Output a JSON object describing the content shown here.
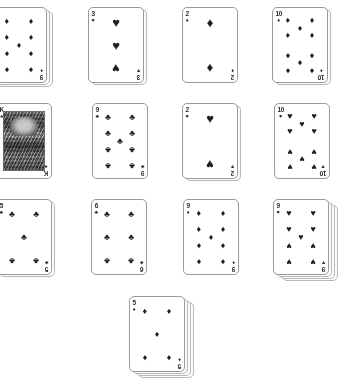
{
  "scene": {
    "title": "Playing card layout",
    "background_color": "#ffffff",
    "card_face_color": "#ffffff",
    "card_border_color": "#9a9a9a",
    "pip_color": "#1f1f1f",
    "card_width": 56,
    "card_height": 76,
    "card_count_visible": 13
  },
  "suit_glyphs": {
    "spades": "♠",
    "hearts": "♥",
    "diamonds": "♦",
    "clubs": "♣"
  },
  "cards": [
    {
      "id": "r1c1",
      "rank": "9",
      "suit": "diamonds",
      "suit_glyph": "♦",
      "label": "9 of Diamonds",
      "x": -9,
      "y": 7,
      "stack_behind": 2,
      "court": false,
      "clipped": "left"
    },
    {
      "id": "r1c2",
      "rank": "3",
      "suit": "hearts",
      "suit_glyph": "♥",
      "label": "3 of Hearts",
      "x": 88,
      "y": 7,
      "stack_behind": 1,
      "court": false,
      "clipped": ""
    },
    {
      "id": "r1c3",
      "rank": "2",
      "suit": "diamonds",
      "suit_glyph": "♦",
      "label": "2 of Diamonds",
      "x": 182,
      "y": 7,
      "stack_behind": 0,
      "court": false,
      "clipped": ""
    },
    {
      "id": "r1c4",
      "rank": "10",
      "suit": "diamonds",
      "suit_glyph": "♦",
      "label": "10 of Diamonds",
      "x": 272,
      "y": 7,
      "stack_behind": 1,
      "court": false,
      "clipped": ""
    },
    {
      "id": "r2c1",
      "rank": "K",
      "suit": "spades",
      "suit_glyph": "♠",
      "label": "King of Spades",
      "x": -4,
      "y": 103,
      "stack_behind": 0,
      "court": true,
      "clipped": "left"
    },
    {
      "id": "r2c2",
      "rank": "9",
      "suit": "clubs",
      "suit_glyph": "♣",
      "label": "9 of Clubs",
      "x": 92,
      "y": 103,
      "stack_behind": 0,
      "court": false,
      "clipped": ""
    },
    {
      "id": "r2c3",
      "rank": "2",
      "suit": "hearts",
      "suit_glyph": "♥",
      "label": "2 of Hearts",
      "x": 182,
      "y": 103,
      "stack_behind": 1,
      "court": false,
      "clipped": ""
    },
    {
      "id": "r2c4",
      "rank": "10",
      "suit": "hearts",
      "suit_glyph": "♥",
      "label": "10 of Hearts",
      "x": 274,
      "y": 103,
      "stack_behind": 0,
      "court": false,
      "clipped": ""
    },
    {
      "id": "r3c1",
      "rank": "5",
      "suit": "clubs",
      "suit_glyph": "♣",
      "label": "5 of Clubs",
      "x": -4,
      "y": 199,
      "stack_behind": 1,
      "court": false,
      "clipped": "left"
    },
    {
      "id": "r3c2",
      "rank": "6",
      "suit": "clubs",
      "suit_glyph": "♣",
      "label": "6 of Clubs",
      "x": 91,
      "y": 199,
      "stack_behind": 0,
      "court": false,
      "clipped": ""
    },
    {
      "id": "r3c3",
      "rank": "9",
      "suit": "diamonds",
      "suit_glyph": "♦",
      "label": "9 of Diamonds",
      "x": 183,
      "y": 199,
      "stack_behind": 0,
      "court": false,
      "clipped": ""
    },
    {
      "id": "r3c4",
      "rank": "9",
      "suit": "hearts",
      "suit_glyph": "♥",
      "label": "9 of Hearts",
      "x": 273,
      "y": 199,
      "stack_behind": 3,
      "court": false,
      "clipped": ""
    },
    {
      "id": "r4c1",
      "rank": "5",
      "suit": "diamonds",
      "suit_glyph": "♦",
      "label": "5 of Diamonds",
      "x": 129,
      "y": 296,
      "stack_behind": 3,
      "court": false,
      "clipped": "bottom"
    }
  ],
  "pip_layouts": {
    "2": [
      [
        50,
        14,
        0
      ],
      [
        50,
        86,
        1
      ]
    ],
    "3": [
      [
        50,
        14,
        0
      ],
      [
        50,
        50,
        0
      ],
      [
        50,
        86,
        1
      ]
    ],
    "5": [
      [
        18,
        14,
        0
      ],
      [
        82,
        14,
        0
      ],
      [
        50,
        50,
        0
      ],
      [
        18,
        86,
        1
      ],
      [
        82,
        86,
        1
      ]
    ],
    "6": [
      [
        18,
        14,
        0
      ],
      [
        82,
        14,
        0
      ],
      [
        18,
        50,
        0
      ],
      [
        82,
        50,
        0
      ],
      [
        18,
        86,
        1
      ],
      [
        82,
        86,
        1
      ]
    ],
    "9": [
      [
        18,
        12,
        0
      ],
      [
        82,
        12,
        0
      ],
      [
        18,
        37,
        0
      ],
      [
        82,
        37,
        0
      ],
      [
        50,
        50,
        0
      ],
      [
        18,
        63,
        1
      ],
      [
        82,
        63,
        1
      ],
      [
        18,
        88,
        1
      ],
      [
        82,
        88,
        1
      ]
    ],
    "10": [
      [
        18,
        11,
        0
      ],
      [
        82,
        11,
        0
      ],
      [
        50,
        24,
        0
      ],
      [
        18,
        35,
        0
      ],
      [
        82,
        35,
        0
      ],
      [
        18,
        65,
        1
      ],
      [
        82,
        65,
        1
      ],
      [
        50,
        76,
        1
      ],
      [
        18,
        89,
        1
      ],
      [
        82,
        89,
        1
      ]
    ]
  }
}
